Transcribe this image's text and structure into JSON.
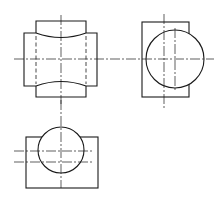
{
  "drawing": {
    "title": "Three-view orthographic projection",
    "views": [
      {
        "name": "front-view"
      },
      {
        "name": "side-view"
      },
      {
        "name": "top-view"
      }
    ],
    "colors": {
      "line": "#1a1a1a",
      "background": "#ffffff"
    }
  }
}
